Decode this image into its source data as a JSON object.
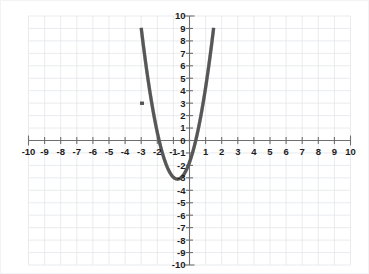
{
  "chart_data": {
    "type": "line",
    "title": "",
    "subtitle": "",
    "xlabel": "",
    "ylabel": "",
    "xlim": [
      -10,
      10
    ],
    "ylim": [
      -10,
      10
    ],
    "grid": true,
    "legend": null,
    "legend_position": "none",
    "curve_color": "#565656",
    "grid_color": "#e3e6ea",
    "axis_color": "#6f6f6f",
    "background_color": "#ffffff",
    "x_ticks": [
      -10,
      -9,
      -8,
      -7,
      -6,
      -5,
      -4,
      -3,
      -2,
      -1,
      0,
      1,
      2,
      3,
      4,
      5,
      6,
      7,
      8,
      9,
      10
    ],
    "x_tick_labels": [
      "-10",
      "-9",
      "-8",
      "-7",
      "-6",
      "-5",
      "-4",
      "-3",
      "-2",
      "-1",
      "",
      "1",
      "2",
      "3",
      "4",
      "5",
      "6",
      "7",
      "8",
      "9",
      "10"
    ],
    "y_ticks": [
      -10,
      -9,
      -8,
      -7,
      -6,
      -5,
      -4,
      -3,
      -2,
      -1,
      0,
      1,
      2,
      3,
      4,
      5,
      6,
      7,
      8,
      9,
      10
    ],
    "y_tick_labels": [
      "-10",
      "-9",
      "-8",
      "-7",
      "-6",
      "-5",
      "-4",
      "-3",
      "-2",
      "-1",
      "0",
      "1",
      "2",
      "3",
      "4",
      "5",
      "6",
      "7",
      "8",
      "9",
      "10"
    ],
    "origin_label": "0",
    "series": [
      {
        "name": "parabola",
        "kind": "parabola",
        "equation_form": "y = a(x - h)^2 + k",
        "a": 2.4,
        "vertex_x": -0.75,
        "vertex_y": -3.1,
        "roots": [
          -2.4,
          0.9
        ],
        "y_intercept": -1.75,
        "x_domain": [
          -3.0,
          1.5
        ],
        "points": [
          {
            "x": -3.0,
            "y": 10.5
          },
          {
            "x": -2.75,
            "y": 6.6
          },
          {
            "x": -2.5,
            "y": 4.3
          },
          {
            "x": -2.4,
            "y": 0.0
          },
          {
            "x": -2.25,
            "y": 2.3
          },
          {
            "x": -2.0,
            "y": 0.9
          },
          {
            "x": -1.75,
            "y": -0.6
          },
          {
            "x": -1.5,
            "y": -1.7
          },
          {
            "x": -1.25,
            "y": -2.5
          },
          {
            "x": -1.0,
            "y": -2.95
          },
          {
            "x": -0.75,
            "y": -3.1
          },
          {
            "x": -0.5,
            "y": -2.95
          },
          {
            "x": -0.25,
            "y": -2.5
          },
          {
            "x": 0.0,
            "y": -1.75
          },
          {
            "x": 0.25,
            "y": -0.7
          },
          {
            "x": 0.5,
            "y": 0.6
          },
          {
            "x": 0.75,
            "y": 2.3
          },
          {
            "x": 1.0,
            "y": 4.3
          },
          {
            "x": 1.25,
            "y": 6.6
          },
          {
            "x": 1.5,
            "y": 10.4
          }
        ]
      }
    ],
    "annotations": [
      {
        "type": "kink",
        "x": -3.0,
        "y": 3.0,
        "note": "small notch artifact on left branch"
      }
    ]
  }
}
